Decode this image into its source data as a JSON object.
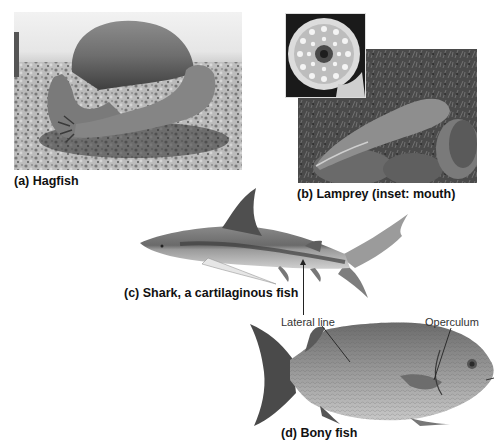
{
  "figure": {
    "panels": [
      {
        "id": "a",
        "caption": "(a) Hagfish",
        "subject": "hagfish-photo"
      },
      {
        "id": "b",
        "caption": "(b) Lamprey (inset: mouth)",
        "subject": "lamprey-photo",
        "inset": "lamprey-mouth-inset"
      },
      {
        "id": "c",
        "caption": "(c) Shark, a cartilaginous fish",
        "subject": "shark-photo"
      },
      {
        "id": "d",
        "caption": "(d) Bony fish",
        "subject": "bony-fish-photo"
      }
    ],
    "annotations": {
      "lateral_line": "Lateral line",
      "operculum": "Operculum"
    },
    "colors": {
      "background": "#ffffff",
      "caption_text": "#111111",
      "annotation_text": "#333333",
      "leader_line": "#222222"
    }
  }
}
